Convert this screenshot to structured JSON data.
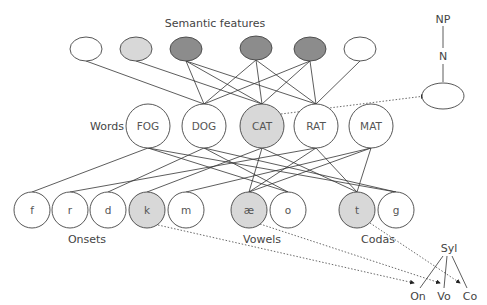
{
  "title": "Semantic features",
  "colors": {
    "white": "#ffffff",
    "light": "#d8d8d8",
    "dark": "#8c8c8c",
    "stroke": "#444444"
  },
  "labels": {
    "semantic": "Semantic features",
    "words": "Words",
    "onsets": "Onsets",
    "vowels": "Vowels",
    "codas": "Codas",
    "np": "NP",
    "n": "N",
    "syl": "Syl",
    "on": "On",
    "vo": "Vo",
    "co": "Co"
  },
  "semantic_features": [
    {
      "id": "s1",
      "x": 86,
      "y": 49,
      "fill": "white"
    },
    {
      "id": "s2",
      "x": 136,
      "y": 49,
      "fill": "light"
    },
    {
      "id": "s3",
      "x": 186,
      "y": 49,
      "fill": "dark"
    },
    {
      "id": "s4",
      "x": 256,
      "y": 48,
      "fill": "dark"
    },
    {
      "id": "s5",
      "x": 310,
      "y": 49,
      "fill": "dark"
    },
    {
      "id": "s6",
      "x": 360,
      "y": 49,
      "fill": "white"
    }
  ],
  "words": [
    {
      "id": "FOG",
      "label": "FOG",
      "x": 148,
      "y": 126,
      "fill": "white"
    },
    {
      "id": "DOG",
      "label": "DOG",
      "x": 204,
      "y": 126,
      "fill": "white"
    },
    {
      "id": "CAT",
      "label": "CAT",
      "x": 262,
      "y": 126,
      "fill": "light"
    },
    {
      "id": "RAT",
      "label": "RAT",
      "x": 316,
      "y": 126,
      "fill": "white"
    },
    {
      "id": "MAT",
      "label": "MAT",
      "x": 371,
      "y": 126,
      "fill": "white"
    }
  ],
  "letters": [
    {
      "id": "f",
      "label": "f",
      "x": 32,
      "y": 210,
      "fill": "white"
    },
    {
      "id": "r",
      "label": "r",
      "x": 70,
      "y": 210,
      "fill": "white"
    },
    {
      "id": "d",
      "label": "d",
      "x": 108,
      "y": 210,
      "fill": "white"
    },
    {
      "id": "k",
      "label": "k",
      "x": 147,
      "y": 210,
      "fill": "light"
    },
    {
      "id": "m",
      "label": "m",
      "x": 186,
      "y": 210,
      "fill": "white"
    },
    {
      "id": "ae",
      "label": "æ",
      "x": 249,
      "y": 210,
      "fill": "light"
    },
    {
      "id": "o",
      "label": "o",
      "x": 288,
      "y": 210,
      "fill": "white"
    },
    {
      "id": "t",
      "label": "t",
      "x": 357,
      "y": 210,
      "fill": "light"
    },
    {
      "id": "g",
      "label": "g",
      "x": 396,
      "y": 210,
      "fill": "white"
    }
  ],
  "semantic_edges": [
    [
      "s1",
      "DOG"
    ],
    [
      "s2",
      "CAT"
    ],
    [
      "s3",
      "DOG"
    ],
    [
      "s3",
      "CAT"
    ],
    [
      "s3",
      "RAT"
    ],
    [
      "s4",
      "DOG"
    ],
    [
      "s4",
      "CAT"
    ],
    [
      "s4",
      "RAT"
    ],
    [
      "s5",
      "DOG"
    ],
    [
      "s5",
      "CAT"
    ],
    [
      "s5",
      "RAT"
    ],
    [
      "s6",
      "RAT"
    ]
  ],
  "word_letter_edges": [
    [
      "FOG",
      "f"
    ],
    [
      "FOG",
      "o"
    ],
    [
      "FOG",
      "g"
    ],
    [
      "DOG",
      "d"
    ],
    [
      "DOG",
      "o"
    ],
    [
      "DOG",
      "g"
    ],
    [
      "CAT",
      "k"
    ],
    [
      "CAT",
      "ae"
    ],
    [
      "CAT",
      "t"
    ],
    [
      "RAT",
      "r"
    ],
    [
      "RAT",
      "ae"
    ],
    [
      "RAT",
      "t"
    ],
    [
      "MAT",
      "m"
    ],
    [
      "MAT",
      "ae"
    ],
    [
      "MAT",
      "t"
    ]
  ]
}
